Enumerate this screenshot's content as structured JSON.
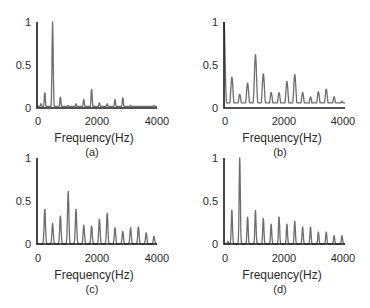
{
  "figure": {
    "panels": [
      {
        "id": "a",
        "caption": "(a)",
        "xlabel": "Frequency(Hz)",
        "yticks": [
          "0",
          "0.5",
          "1"
        ],
        "xticks": [
          "0",
          "2000",
          "4000"
        ]
      },
      {
        "id": "b",
        "caption": "(b)",
        "xlabel": "Frequency(Hz)",
        "yticks": [
          "0",
          "0.5",
          "1"
        ],
        "xticks": [
          "0",
          "2000",
          "4000"
        ]
      },
      {
        "id": "c",
        "caption": "(c)",
        "xlabel": "Frequency(Hz)",
        "yticks": [
          "0",
          "0.5",
          "1"
        ],
        "xticks": [
          "0",
          "2000",
          "4000"
        ]
      },
      {
        "id": "d",
        "caption": "(d)",
        "xlabel": "Frequency(Hz)",
        "yticks": [
          "0",
          "0.5",
          "1"
        ],
        "xticks": [
          "0",
          "2000",
          "4000"
        ]
      }
    ],
    "colors": {
      "axis": "#1a1a1a",
      "trace": "#6e6e6e",
      "text": "#2a2a2a"
    }
  },
  "chart_data": [
    {
      "type": "line",
      "title": "(a)",
      "xlabel": "Frequency(Hz)",
      "ylabel": "",
      "xlim": [
        0,
        4000
      ],
      "ylim": [
        0,
        1
      ],
      "grid": false,
      "peak_width_hz": 60,
      "floor": 0.02,
      "x": [
        130,
        260,
        520,
        780,
        1040,
        1300,
        1560,
        1820,
        2080,
        2340,
        2600,
        2860,
        3120,
        3380,
        3640,
        3900
      ],
      "values": [
        0.05,
        0.18,
        1.0,
        0.13,
        0.03,
        0.05,
        0.1,
        0.22,
        0.06,
        0.05,
        0.1,
        0.12,
        0.03,
        0.02,
        0.02,
        0.03
      ]
    },
    {
      "type": "line",
      "title": "(b)",
      "xlabel": "Frequency(Hz)",
      "ylabel": "",
      "xlim": [
        0,
        4000
      ],
      "ylim": [
        0,
        1
      ],
      "grid": false,
      "peak_width_hz": 110,
      "floor": 0.06,
      "x": [
        0,
        260,
        520,
        780,
        1040,
        1300,
        1560,
        1820,
        2080,
        2340,
        2600,
        2860,
        3120,
        3380,
        3640,
        3900
      ],
      "values": [
        1.0,
        0.36,
        0.16,
        0.29,
        0.62,
        0.4,
        0.18,
        0.18,
        0.31,
        0.39,
        0.18,
        0.13,
        0.19,
        0.22,
        0.13,
        0.08
      ]
    },
    {
      "type": "line",
      "title": "(c)",
      "xlabel": "Frequency(Hz)",
      "ylabel": "",
      "xlim": [
        0,
        4000
      ],
      "ylim": [
        0,
        1
      ],
      "grid": false,
      "peak_width_hz": 70,
      "floor": 0.0,
      "x": [
        260,
        520,
        780,
        1040,
        1300,
        1560,
        1820,
        2080,
        2340,
        2600,
        2860,
        3120,
        3380,
        3640,
        3900
      ],
      "values": [
        0.41,
        0.24,
        0.33,
        0.61,
        0.41,
        0.22,
        0.21,
        0.29,
        0.36,
        0.19,
        0.15,
        0.19,
        0.2,
        0.13,
        0.09
      ]
    },
    {
      "type": "line",
      "title": "(d)",
      "xlabel": "Frequency(Hz)",
      "ylabel": "",
      "xlim": [
        0,
        4000
      ],
      "ylim": [
        0,
        1
      ],
      "grid": false,
      "peak_width_hz": 60,
      "floor": 0.0,
      "x": [
        130,
        260,
        520,
        780,
        1040,
        1300,
        1560,
        1820,
        2080,
        2340,
        2600,
        2860,
        3120,
        3380,
        3640,
        3900
      ],
      "values": [
        0.03,
        0.4,
        1.0,
        0.32,
        0.39,
        0.3,
        0.23,
        0.32,
        0.23,
        0.27,
        0.2,
        0.2,
        0.14,
        0.14,
        0.1,
        0.1
      ]
    }
  ]
}
